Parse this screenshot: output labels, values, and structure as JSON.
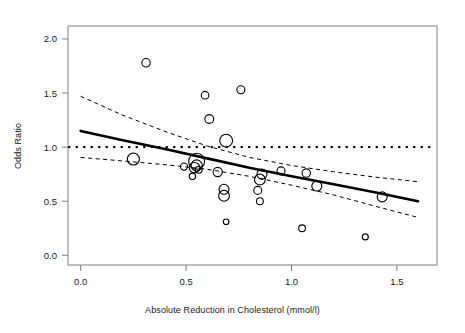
{
  "figure": {
    "type": "meta-regression-bubble-plot",
    "background": "#ffffff",
    "frame_color": "#808080"
  },
  "chart_data": {
    "type": "scatter",
    "title": "",
    "xlabel": "Absolute Reduction in Cholesterol (mmol/l)",
    "ylabel": "Odds Ratio",
    "xlim": [
      -0.06,
      1.69
    ],
    "ylim": [
      -0.09,
      2.12
    ],
    "xticks": [
      0.0,
      0.5,
      1.0,
      1.5
    ],
    "xticklabels": [
      "0.0",
      "0.5",
      "1.0",
      "1.5"
    ],
    "yticks": [
      0.0,
      0.5,
      1.0,
      1.5,
      2.0
    ],
    "yticklabels": [
      "0.0",
      "0.5",
      "1.0",
      "1.5",
      "2.0"
    ],
    "grid": false,
    "legend": false,
    "marker": "open-circle",
    "marker_color": "#000000",
    "marker_fill": "none",
    "size_encoding": "study weight (inverse variance)",
    "points": [
      {
        "x": 0.25,
        "y": 0.89,
        "r": 6.0
      },
      {
        "x": 0.31,
        "y": 1.78,
        "r": 4.2
      },
      {
        "x": 0.49,
        "y": 0.82,
        "r": 3.6
      },
      {
        "x": 0.53,
        "y": 0.73,
        "r": 3.2
      },
      {
        "x": 0.54,
        "y": 0.81,
        "r": 5.2
      },
      {
        "x": 0.55,
        "y": 0.87,
        "r": 8.0
      },
      {
        "x": 0.55,
        "y": 0.83,
        "r": 5.6
      },
      {
        "x": 0.56,
        "y": 0.79,
        "r": 3.4
      },
      {
        "x": 0.59,
        "y": 1.48,
        "r": 3.8
      },
      {
        "x": 0.61,
        "y": 1.26,
        "r": 4.4
      },
      {
        "x": 0.65,
        "y": 0.77,
        "r": 4.6
      },
      {
        "x": 0.68,
        "y": 0.61,
        "r": 5.0
      },
      {
        "x": 0.68,
        "y": 0.55,
        "r": 5.4
      },
      {
        "x": 0.69,
        "y": 1.06,
        "r": 6.4
      },
      {
        "x": 0.69,
        "y": 0.31,
        "r": 2.8
      },
      {
        "x": 0.76,
        "y": 1.53,
        "r": 4.0
      },
      {
        "x": 0.84,
        "y": 0.6,
        "r": 4.0
      },
      {
        "x": 0.85,
        "y": 0.7,
        "r": 5.4
      },
      {
        "x": 0.85,
        "y": 0.5,
        "r": 3.4
      },
      {
        "x": 0.86,
        "y": 0.75,
        "r": 5.0
      },
      {
        "x": 0.95,
        "y": 0.78,
        "r": 4.0
      },
      {
        "x": 1.05,
        "y": 0.25,
        "r": 3.4
      },
      {
        "x": 1.07,
        "y": 0.76,
        "r": 4.2
      },
      {
        "x": 1.12,
        "y": 0.64,
        "r": 5.0
      },
      {
        "x": 1.35,
        "y": 0.17,
        "r": 3.0
      },
      {
        "x": 1.43,
        "y": 0.54,
        "r": 5.0
      }
    ],
    "fit_line": {
      "name": "fitted meta-regression",
      "style": "solid",
      "width": 2.6,
      "color": "#000000",
      "points": [
        {
          "x": 0.0,
          "y": 1.15
        },
        {
          "x": 0.2,
          "y": 1.064
        },
        {
          "x": 0.4,
          "y": 0.983
        },
        {
          "x": 0.6,
          "y": 0.896
        },
        {
          "x": 0.8,
          "y": 0.81
        },
        {
          "x": 1.0,
          "y": 0.731
        },
        {
          "x": 1.2,
          "y": 0.657
        },
        {
          "x": 1.4,
          "y": 0.58
        },
        {
          "x": 1.6,
          "y": 0.5
        }
      ]
    },
    "confidence_band_upper": {
      "name": "95% CI upper",
      "style": "dashed",
      "width": 1.0,
      "color": "#000000",
      "points": [
        {
          "x": 0.0,
          "y": 1.47
        },
        {
          "x": 0.2,
          "y": 1.295
        },
        {
          "x": 0.4,
          "y": 1.145
        },
        {
          "x": 0.6,
          "y": 1.01
        },
        {
          "x": 0.8,
          "y": 0.905
        },
        {
          "x": 1.0,
          "y": 0.83
        },
        {
          "x": 1.2,
          "y": 0.772
        },
        {
          "x": 1.4,
          "y": 0.722
        },
        {
          "x": 1.6,
          "y": 0.68
        }
      ]
    },
    "confidence_band_lower": {
      "name": "95% CI lower",
      "style": "dashed",
      "width": 1.0,
      "color": "#000000",
      "points": [
        {
          "x": 0.0,
          "y": 0.905
        },
        {
          "x": 0.2,
          "y": 0.872
        },
        {
          "x": 0.4,
          "y": 0.838
        },
        {
          "x": 0.6,
          "y": 0.795
        },
        {
          "x": 0.8,
          "y": 0.73
        },
        {
          "x": 1.0,
          "y": 0.648
        },
        {
          "x": 1.2,
          "y": 0.558
        },
        {
          "x": 1.4,
          "y": 0.452
        },
        {
          "x": 1.6,
          "y": 0.35
        }
      ]
    },
    "reference_line": {
      "name": "no-effect line",
      "orientation": "horizontal",
      "value": 1.0,
      "style": "dotted",
      "width": 2.2,
      "color": "#000000"
    }
  }
}
